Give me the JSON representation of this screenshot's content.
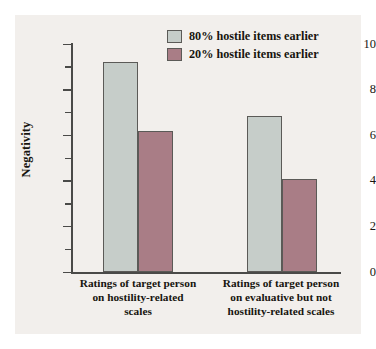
{
  "chart_data": {
    "type": "bar",
    "title": "",
    "subtitle": "",
    "xlabel": "",
    "ylabel": "Negativity",
    "ylim": [
      0,
      10
    ],
    "ytick_labels": [
      "0",
      "2",
      "4",
      "6",
      "8",
      "10"
    ],
    "ytick_values": [
      0,
      2,
      4,
      6,
      8,
      10
    ],
    "yminor_values": [
      1,
      3,
      5,
      7,
      9
    ],
    "grid": false,
    "legend_position": "top-right",
    "categories": [
      "Ratings of target person on hostility-related scales",
      "Ratings of target person on evaluative but not hostility-related scales"
    ],
    "category_label_lines": [
      [
        "Ratings of target person",
        "on hostility-related",
        "scales"
      ],
      [
        "Ratings of target person",
        "on evaluative but not",
        "hostility-related scales"
      ]
    ],
    "series": [
      {
        "name": "80% hostile items earlier",
        "color": "#c6cdc9",
        "values": [
          9.2,
          6.85
        ]
      },
      {
        "name": "20% hostile items earlier",
        "color": "#a97d86",
        "values": [
          6.2,
          4.1
        ]
      }
    ]
  },
  "legend": {
    "items": [
      {
        "label": "80% hostile items earlier",
        "color": "#c6cdc9"
      },
      {
        "label": "20% hostile items earlier",
        "color": "#a97d86"
      }
    ]
  },
  "axes": {
    "y_title": "Negativity",
    "y_ticks": [
      {
        "label": "10",
        "value": 10
      },
      {
        "label": "8",
        "value": 8
      },
      {
        "label": "6",
        "value": 6
      },
      {
        "label": "4",
        "value": 4
      },
      {
        "label": "2",
        "value": 2
      },
      {
        "label": "0",
        "value": 0
      }
    ]
  },
  "colors": {
    "panel_background": "#f2efec",
    "page_background": "#ffffff",
    "axis": "#4a4a48",
    "bar_outline": "#5b5a57",
    "text": "#17150f",
    "series_a": "#c6cdc9",
    "series_b": "#a97d86"
  }
}
